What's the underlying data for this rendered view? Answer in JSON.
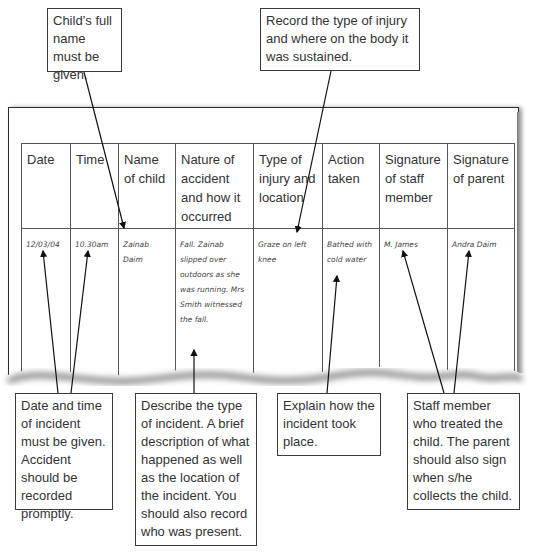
{
  "callouts": {
    "name": "Child’s full name must be given.",
    "injury": "Record the type of injury and where on the body it was sustained.",
    "datetime": "Date and time of incident must be given. Accident should be recorded promptly.",
    "describe": "Describe the type of incident. A brief description of what happened as well as the location of the incident. You should also record who was present.",
    "explain": "Explain how the incident took place.",
    "staff": "Staff member who treated the child. The parent should also sign when s/he collects the child."
  },
  "table": {
    "headers": [
      "Date",
      "Time",
      "Name of child",
      "Nature of accident and how it occurred",
      "Type of injury and location",
      "Action taken",
      "Signature of staff member",
      "Signature of parent"
    ],
    "row": [
      "12/03/04",
      "10.30am",
      "Zainab Daim",
      "Fall. Zainab slipped over outdoors as she was running. Mrs Smith witnessed the fall.",
      "Graze on left knee",
      "Bathed with cold water",
      "M. James",
      "Andra Daim"
    ]
  },
  "colors": {
    "line": "#2a2a2a",
    "text": "#333333",
    "handwriting": "#444444",
    "paper_shadow": "#888888"
  }
}
